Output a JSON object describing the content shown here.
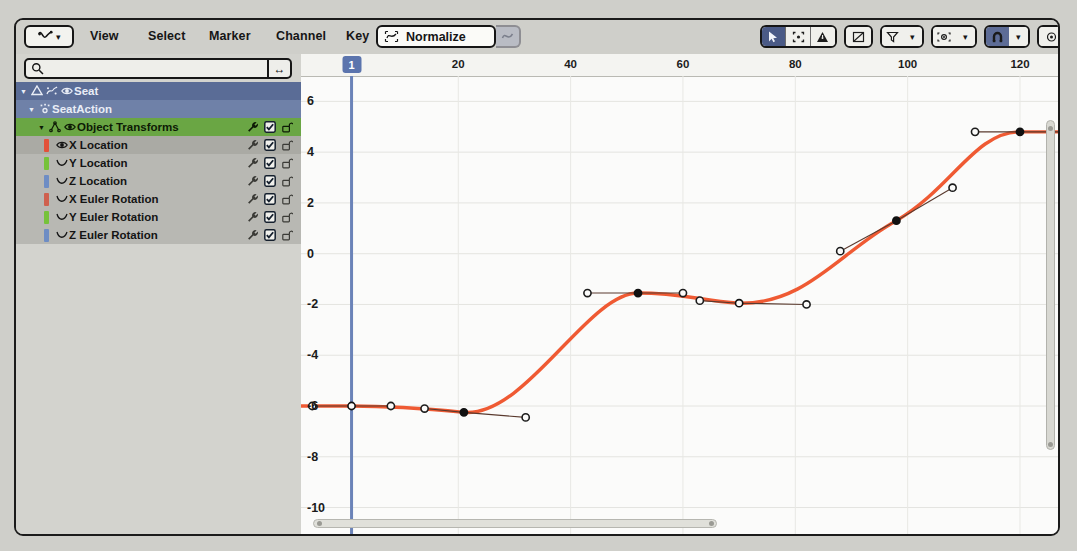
{
  "header": {
    "editor_type_icon": "graph-editor-icon",
    "menus": [
      "View",
      "Select",
      "Marker",
      "Channel",
      "Key"
    ],
    "normalize": {
      "label": "Normalize",
      "icon": "normalize-icon",
      "auto_icon": "auto-normalize-icon"
    },
    "tools_right": [
      {
        "name": "cursor-select-icon",
        "active": true
      },
      {
        "name": "box-select-icon",
        "active": false
      },
      {
        "name": "only-selected-curves-icon",
        "active": false
      },
      {
        "name": "ghost-curves-icon",
        "active": false
      },
      {
        "name": "filter-funnel-icon",
        "active": false,
        "dropdown": true
      },
      {
        "name": "proportional-edit-icon",
        "active": false,
        "dropdown": true
      },
      {
        "name": "snap-magnet-icon",
        "active": true,
        "dropdown": true
      },
      {
        "name": "pivot-point-icon",
        "active": false
      },
      {
        "name": "handle-type-icon",
        "active": false,
        "dropdown": true
      }
    ]
  },
  "channels": {
    "search": {
      "value": "",
      "placeholder": "",
      "icon": "search-icon",
      "filter_icon": "expand-arrows-icon"
    },
    "rows": [
      {
        "label": "Seat",
        "kind": "object",
        "depth": 0,
        "expanded": true,
        "icons": [
          "object-icon",
          "animation-icon",
          "visibility-eye-icon"
        ],
        "tools": []
      },
      {
        "label": "SeatAction",
        "kind": "action",
        "depth": 1,
        "expanded": true,
        "icons": [
          "action-icon"
        ],
        "tools": []
      },
      {
        "label": "Object Transforms",
        "kind": "group",
        "depth": 2,
        "expanded": true,
        "icons": [
          "group-icon",
          "visibility-eye-icon"
        ],
        "tools": [
          "modifier-wrench-icon",
          "enable-checkbox-icon",
          "lock-open-icon"
        ]
      },
      {
        "label": "X Location",
        "kind": "fcurve",
        "depth": 3,
        "color": "#e2513a",
        "selected": true,
        "icons": [
          "visibility-eye-icon"
        ],
        "tools": [
          "modifier-wrench-icon",
          "enable-checkbox-icon",
          "lock-open-icon"
        ]
      },
      {
        "label": "Y Location",
        "kind": "fcurve",
        "depth": 3,
        "color": "#76c23a",
        "selected": false,
        "icons": [
          "fcurve-icon"
        ],
        "tools": [
          "modifier-wrench-icon",
          "enable-checkbox-icon",
          "lock-open-icon"
        ]
      },
      {
        "label": "Z Location",
        "kind": "fcurve",
        "depth": 3,
        "color": "#6e8dc4",
        "selected": false,
        "icons": [
          "fcurve-icon"
        ],
        "tools": [
          "modifier-wrench-icon",
          "enable-checkbox-icon",
          "lock-open-icon"
        ]
      },
      {
        "label": "X Euler Rotation",
        "kind": "fcurve",
        "depth": 3,
        "color": "#cf604e",
        "selected": false,
        "icons": [
          "fcurve-icon"
        ],
        "tools": [
          "modifier-wrench-icon",
          "enable-checkbox-icon",
          "lock-open-icon"
        ]
      },
      {
        "label": "Y Euler Rotation",
        "kind": "fcurve",
        "depth": 3,
        "color": "#76c23a",
        "selected": false,
        "icons": [
          "fcurve-icon"
        ],
        "tools": [
          "modifier-wrench-icon",
          "enable-checkbox-icon",
          "lock-open-icon"
        ]
      },
      {
        "label": "Z Euler Rotation",
        "kind": "fcurve",
        "depth": 3,
        "color": "#6e8dc4",
        "selected": false,
        "icons": [
          "fcurve-icon"
        ],
        "tools": [
          "modifier-wrench-icon",
          "enable-checkbox-icon",
          "lock-open-icon"
        ]
      }
    ]
  },
  "chart_data": {
    "type": "line",
    "title": "",
    "xlabel": "",
    "ylabel": "",
    "xlim": [
      -8,
      133
    ],
    "ylim": [
      -11.2,
      7.0
    ],
    "xticks": [
      20,
      40,
      60,
      80,
      100,
      120
    ],
    "yticks": [
      6,
      4,
      2,
      0,
      -2,
      -4,
      -6,
      -8,
      -10
    ],
    "grid": true,
    "current_frame": 1,
    "curve_color": "#ef5a33",
    "series": [
      {
        "name": "X Location",
        "keyframes": [
          {
            "frame": 1,
            "value": -6.0,
            "selected": false,
            "handle_left": {
              "frame": -6,
              "value": -6.0
            },
            "handle_right": {
              "frame": 8,
              "value": -6.0
            }
          },
          {
            "frame": 21,
            "value": -6.25,
            "selected": true,
            "handle_left": {
              "frame": 14,
              "value": -6.1
            },
            "handle_right": {
              "frame": 32,
              "value": -6.45
            }
          },
          {
            "frame": 52,
            "value": -1.55,
            "selected": true,
            "handle_left": {
              "frame": 43,
              "value": -1.55
            },
            "handle_right": {
              "frame": 60,
              "value": -1.55
            }
          },
          {
            "frame": 70,
            "value": -1.95,
            "selected": false,
            "handle_left": {
              "frame": 63,
              "value": -1.85
            },
            "handle_right": {
              "frame": 82,
              "value": -2.0
            }
          },
          {
            "frame": 98,
            "value": 1.3,
            "selected": true,
            "handle_left": {
              "frame": 88,
              "value": 0.1
            },
            "handle_right": {
              "frame": 108,
              "value": 2.6
            }
          },
          {
            "frame": 120,
            "value": 4.8,
            "selected": true,
            "handle_left": {
              "frame": 112,
              "value": 4.8
            },
            "handle_right": {
              "frame": 128,
              "value": 4.8
            }
          }
        ]
      }
    ]
  },
  "scrollbars": {
    "vertical": {
      "name": "vertical-scrollbar"
    },
    "horizontal": {
      "name": "horizontal-scrollbar"
    }
  }
}
